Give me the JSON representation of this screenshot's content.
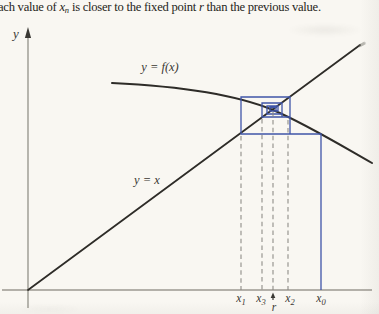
{
  "caption": {
    "prefix": "ach value of ",
    "var_x": "x",
    "var_x_sub": "n",
    "middle": " is closer to the fixed point ",
    "var_r": "r",
    "suffix": " than the previous value."
  },
  "figure": {
    "y_axis_label": "y",
    "curve_label": "y = f(x)",
    "identity_label": "y = x",
    "x_labels": {
      "x1": {
        "base": "x",
        "sub": "1"
      },
      "x3": {
        "base": "x",
        "sub": "3"
      },
      "r": "r",
      "x2": {
        "base": "x",
        "sub": "2"
      },
      "x0": {
        "base": "x",
        "sub": "0"
      }
    },
    "axis_order": [
      "x1",
      "x3",
      "r",
      "x2",
      "x0"
    ],
    "colors": {
      "cobweb_blue": "#3f55a8",
      "curve_black": "#2e2c28",
      "axis_gray": "#9b9991",
      "dashed_gray": "#8b8983",
      "arrow_dark": "#3a3833"
    }
  }
}
